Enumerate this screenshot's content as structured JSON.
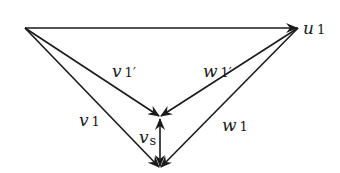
{
  "diagram": {
    "type": "vector-triangle",
    "nodes": {
      "origin": {
        "x": 25,
        "y": 28
      },
      "u1_tip": {
        "x": 298,
        "y": 28
      },
      "mid": {
        "x": 160,
        "y": 117
      },
      "bottom": {
        "x": 160,
        "y": 168
      }
    },
    "labels": {
      "u1": {
        "main": "u",
        "sub": "1",
        "prime": ""
      },
      "v1p": {
        "main": "v",
        "sub": "1",
        "prime": "′"
      },
      "w1p": {
        "main": "w",
        "sub": "1",
        "prime": "′"
      },
      "v1": {
        "main": "v",
        "sub": "1",
        "prime": ""
      },
      "vs": {
        "main": "v",
        "sub": "s",
        "prime": ""
      },
      "w1": {
        "main": "w",
        "sub": "1",
        "prime": ""
      }
    },
    "edges": [
      {
        "id": "u1",
        "from": "origin",
        "to": "u1_tip"
      },
      {
        "id": "v1p",
        "from": "origin",
        "to": "mid"
      },
      {
        "id": "w1p",
        "from": "u1_tip",
        "to": "mid"
      },
      {
        "id": "v1",
        "from": "origin",
        "to": "bottom"
      },
      {
        "id": "w1",
        "from": "u1_tip",
        "to": "bottom"
      },
      {
        "id": "vs",
        "from": "mid",
        "to": "bottom",
        "bidirectional": true
      }
    ],
    "stroke_color": "#1a1a1a"
  }
}
